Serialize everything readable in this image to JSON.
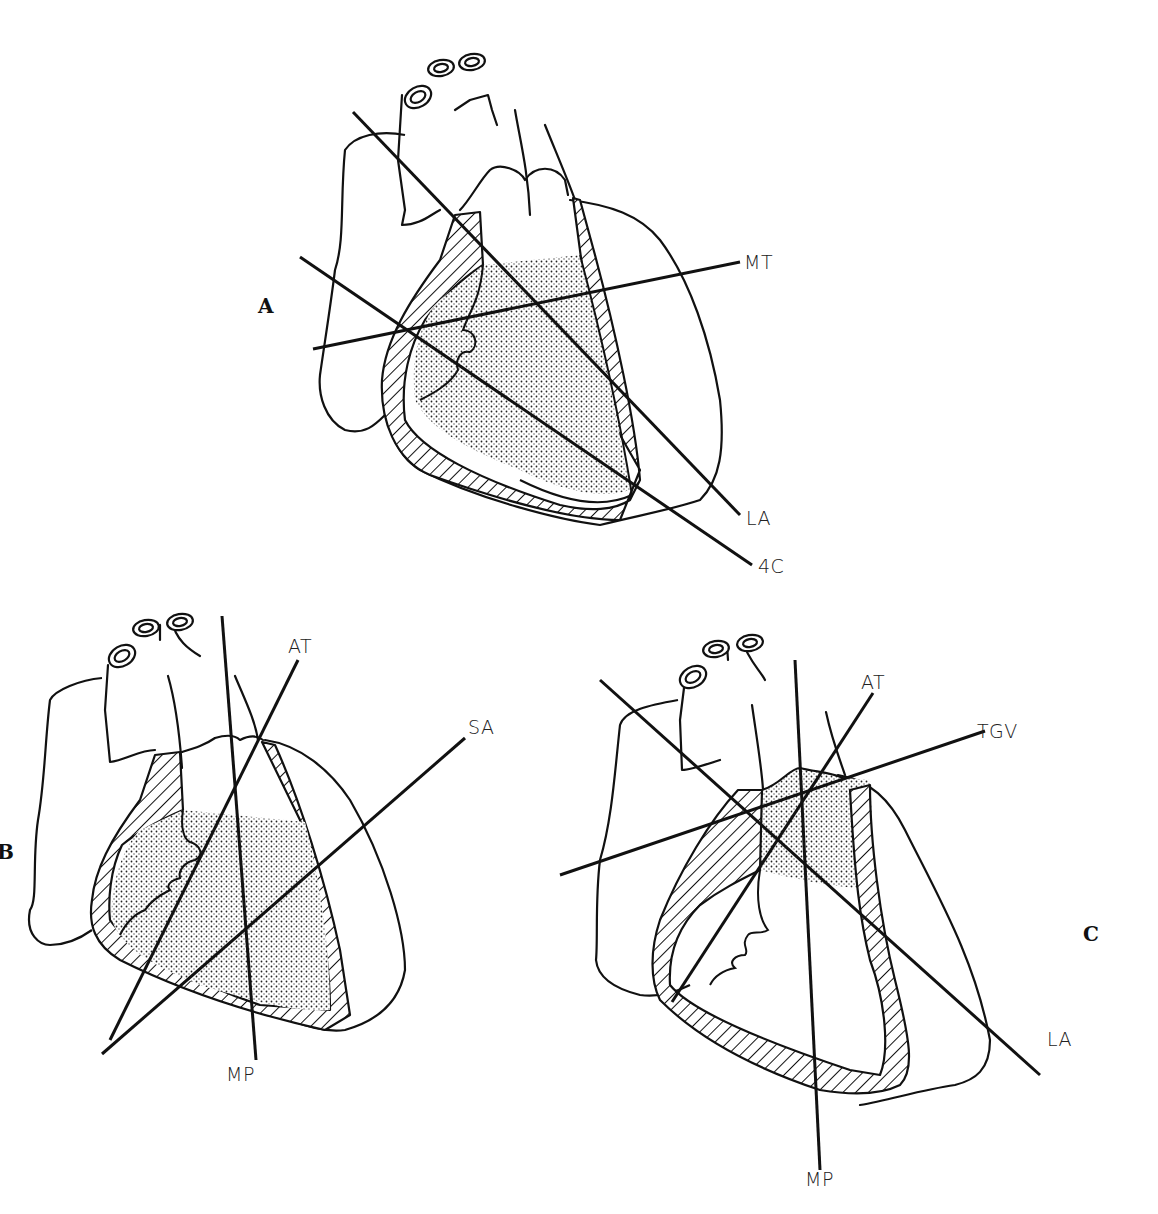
{
  "figure": {
    "panels": [
      {
        "id": "A",
        "label": "A",
        "planes": [
          {
            "label": "MT",
            "name": "mid-transverse"
          },
          {
            "label": "LA",
            "name": "long-axis"
          },
          {
            "label": "4C",
            "name": "four-chamber"
          }
        ]
      },
      {
        "id": "B",
        "label": "B",
        "planes": [
          {
            "label": "AT",
            "name": "apical-transverse"
          },
          {
            "label": "SA",
            "name": "short-axis"
          },
          {
            "label": "MP",
            "name": "mid-papillary"
          }
        ]
      },
      {
        "id": "C",
        "label": "C",
        "planes": [
          {
            "label": "AT",
            "name": "apical-transverse"
          },
          {
            "label": "TGV",
            "name": "transgastric-view"
          },
          {
            "label": "LA",
            "name": "long-axis"
          },
          {
            "label": "MP",
            "name": "mid-papillary"
          }
        ]
      }
    ],
    "colors": {
      "ink": "#111111",
      "background": "#ffffff"
    }
  }
}
